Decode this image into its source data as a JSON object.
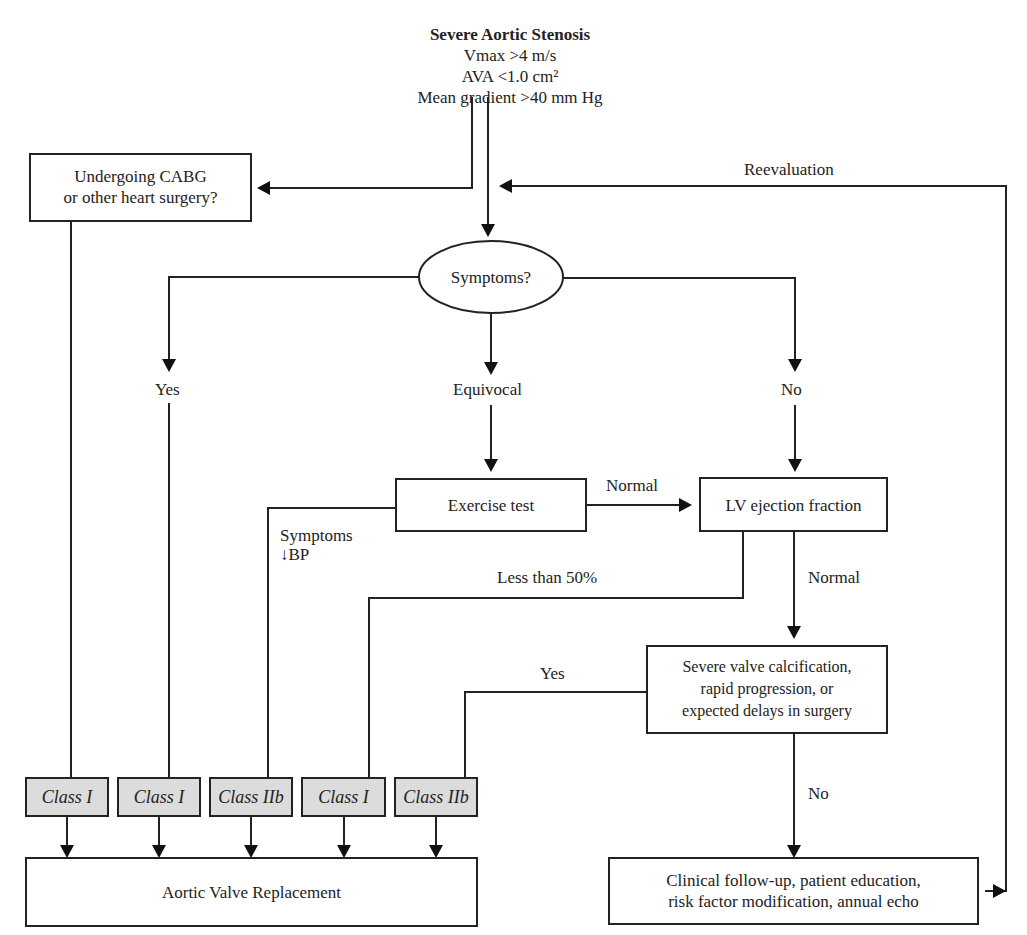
{
  "header": {
    "title": "Severe Aortic Stenosis",
    "criteria": [
      "Vmax >4 m/s",
      "AVA <1.0 cm²",
      "Mean gradient >40 mm Hg"
    ]
  },
  "nodes": {
    "cabg": [
      "Undergoing CABG",
      "or other heart surgery?"
    ],
    "symptoms": "Symptoms?",
    "exercise": "Exercise test",
    "lvef": "LV ejection fraction",
    "calcification": [
      "Severe valve calcification,",
      "rapid progression, or",
      "expected delays in surgery"
    ],
    "avr": "Aortic Valve Replacement",
    "followup": [
      "Clinical follow-up, patient education,",
      "risk factor modification, annual echo"
    ]
  },
  "edge_labels": {
    "reevaluation": "Reevaluation",
    "yes": "Yes",
    "equivocal": "Equivocal",
    "no": "No",
    "normal_exercise": "Normal",
    "symptoms_bp": [
      "Symptoms",
      "↓BP"
    ],
    "less_than_50": "Less than 50%",
    "normal_lvef": "Normal",
    "yes_calc": "Yes",
    "no_calc": "No"
  },
  "classes": [
    "Class I",
    "Class I",
    "Class IIb",
    "Class I",
    "Class IIb"
  ]
}
